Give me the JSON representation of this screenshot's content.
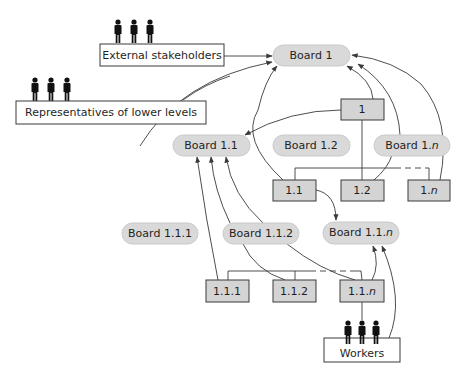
{
  "diagram": {
    "type": "hierarchical governance board diagram",
    "colors": {
      "board_fill": "#d9d9d9",
      "unit_fill": "#d4d4d4",
      "stroke": "#3a3a3a",
      "person": "#111111"
    },
    "groups": {
      "external_stakeholders": {
        "label": "External stakeholders",
        "icon": "people-icon"
      },
      "representatives": {
        "label": "Representatives of lower levels",
        "icon": "people-icon"
      },
      "workers": {
        "label": "Workers",
        "icon": "people-icon"
      }
    },
    "boards": {
      "b1": "Board 1",
      "b11": "Board 1.1",
      "b12": "Board 1.2",
      "b1n_prefix": "Board 1.",
      "b1n_suffix": "n",
      "b111": "Board 1.1.1",
      "b112": "Board 1.1.2",
      "b11n_prefix": "Board 1.1.",
      "b11n_suffix": "n"
    },
    "units": {
      "u1": "1",
      "u11": "1.1",
      "u12": "1.2",
      "u1n_prefix": "1.",
      "u1n_suffix": "n",
      "u111": "1.1.1",
      "u112": "1.1.2",
      "u11n_prefix": "1.1.",
      "u11n_suffix": "n"
    }
  }
}
